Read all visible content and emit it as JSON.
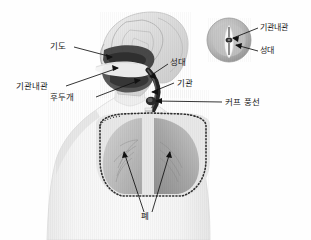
{
  "figure": {
    "type": "medical-illustration",
    "background_color": "#fefefe",
    "ink_color": "#1a1a1a"
  },
  "labels": {
    "airway": "기도",
    "endotracheal_tube": "기관내관",
    "epiglottis": "후두개",
    "vocal_cords": "성대",
    "trachea": "기관",
    "cuff_balloon": "커프 풍선",
    "lungs": "폐"
  },
  "inset": {
    "endotracheal_tube": "기관내관",
    "vocal_cords": "성대"
  },
  "colors": {
    "body_fill": "#f2f2f2",
    "body_stroke": "#d8d8d8",
    "head_fill": "#e3e3e3",
    "airway_dark": "#3a3a3a",
    "tube_dark": "#2b2b2b",
    "lung_left": "#b9b9b9",
    "lung_right": "#a9a9a9",
    "rib_dark": "#2f2f2f",
    "inset_ring": "#b4b4b4",
    "glottis_white": "#fbfbfb",
    "leader_line": "#111111"
  }
}
